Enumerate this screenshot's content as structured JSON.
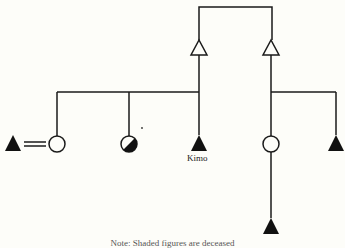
{
  "diagram": {
    "type": "kinship",
    "colors": {
      "line": "#1a1a1a",
      "fill": "#111111",
      "background": "#fdfdf9"
    },
    "labels": {
      "ego": "Kimo"
    },
    "caption": "Note: Shaded figures are deceased",
    "nodes": [
      {
        "id": "parent-1",
        "shape": "triangle",
        "filled": false
      },
      {
        "id": "parent-2",
        "shape": "triangle",
        "filled": false
      },
      {
        "id": "spouse-male",
        "shape": "triangle",
        "filled": true
      },
      {
        "id": "sibling-female-1",
        "shape": "circle",
        "filled": false
      },
      {
        "id": "sibling-female-2",
        "shape": "circle",
        "filled": "half"
      },
      {
        "id": "kimo",
        "shape": "triangle",
        "filled": true,
        "label": "Kimo"
      },
      {
        "id": "cousin-female",
        "shape": "circle",
        "filled": false
      },
      {
        "id": "cousin-male",
        "shape": "triangle",
        "filled": true
      },
      {
        "id": "child-male",
        "shape": "triangle",
        "filled": true
      }
    ]
  }
}
